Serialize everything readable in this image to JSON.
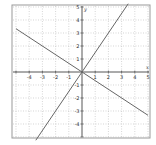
{
  "chart_data": {
    "type": "line",
    "title": "",
    "xlabel": "x",
    "ylabel": "y",
    "xlim": [
      -5,
      5
    ],
    "ylim": [
      -5,
      5
    ],
    "grid": true,
    "grid_style": "dotted",
    "x_ticks": [
      -4,
      -3,
      -2,
      -1,
      1,
      2,
      3,
      4,
      5
    ],
    "y_ticks": [
      -4,
      -3,
      -2,
      -1,
      1,
      2,
      3,
      4,
      5
    ],
    "series": [
      {
        "name": "y = 1.5x",
        "slope": 1.5,
        "intercept": 0,
        "points": [
          [
            -3.5,
            -5.25
          ],
          [
            0,
            0
          ],
          [
            2,
            3
          ],
          [
            3.5,
            5.25
          ]
        ]
      },
      {
        "name": "y = -2x/3",
        "slope": -0.6667,
        "intercept": 0,
        "points": [
          [
            -5,
            3.33
          ],
          [
            -3,
            2
          ],
          [
            0,
            0
          ],
          [
            5,
            -3.33
          ]
        ]
      }
    ],
    "colors": {
      "line": "#666666",
      "axis": "#444444",
      "grid": "#bbbbbb",
      "frame": "#999999"
    }
  }
}
